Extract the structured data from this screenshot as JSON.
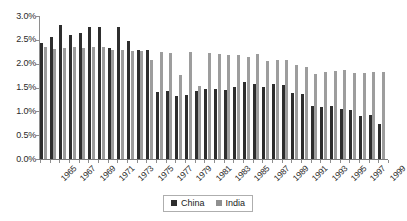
{
  "chart_data": {
    "type": "bar",
    "title": "",
    "subtitle": "",
    "xlabel": "",
    "ylabel": "",
    "ylim": [
      0,
      3.0
    ],
    "ytick_labels": [
      "3.0%",
      "2.5%",
      "2.0%",
      "1.5%",
      "1.0%",
      "0.5%",
      "0.0%"
    ],
    "ytick_values": [
      3.0,
      2.5,
      2.0,
      1.5,
      1.0,
      0.5,
      0.0
    ],
    "grid": false,
    "legend_position": "bottom-center",
    "x": [
      1965,
      1966,
      1967,
      1968,
      1969,
      1970,
      1971,
      1972,
      1973,
      1974,
      1975,
      1976,
      1977,
      1978,
      1979,
      1980,
      1981,
      1982,
      1983,
      1984,
      1985,
      1986,
      1987,
      1988,
      1989,
      1990,
      1991,
      1992,
      1993,
      1994,
      1995,
      1996,
      1997,
      1998,
      1999,
      2000
    ],
    "categories": [
      "1965",
      "1966",
      "1967",
      "1968",
      "1969",
      "1970",
      "1971",
      "1972",
      "1973",
      "1974",
      "1975",
      "1976",
      "1977",
      "1978",
      "1979",
      "1980",
      "1981",
      "1982",
      "1983",
      "1984",
      "1985",
      "1986",
      "1987",
      "1988",
      "1989",
      "1990",
      "1991",
      "1992",
      "1993",
      "1994",
      "1995",
      "1996",
      "1997",
      "1998",
      "1999",
      "2000"
    ],
    "xtick_labels_shown": [
      "1965",
      "1967",
      "1969",
      "1971",
      "1973",
      "1975",
      "1977",
      "1979",
      "1981",
      "1983",
      "1985",
      "1987",
      "1989",
      "1991",
      "1993",
      "1995",
      "1997",
      "1999"
    ],
    "series": [
      {
        "name": "China",
        "color": "#2e2e2e",
        "values": [
          2.44,
          2.55,
          2.82,
          2.6,
          2.65,
          2.78,
          2.77,
          2.32,
          2.77,
          2.48,
          2.28,
          2.28,
          1.4,
          1.42,
          1.32,
          1.35,
          1.43,
          1.46,
          1.46,
          1.44,
          1.52,
          1.61,
          1.58,
          1.52,
          1.58,
          1.55,
          1.38,
          1.36,
          1.12,
          1.1,
          1.12,
          1.04,
          1.02,
          0.91,
          0.92,
          0.74
        ]
      },
      {
        "name": "India",
        "color": "#9d9d9d",
        "values": [
          2.35,
          2.31,
          2.33,
          2.35,
          2.33,
          2.35,
          2.35,
          2.29,
          2.29,
          2.26,
          2.26,
          2.07,
          2.25,
          2.22,
          1.76,
          2.24,
          1.54,
          2.22,
          2.21,
          2.18,
          2.19,
          2.13,
          2.2,
          2.06,
          2.08,
          2.07,
          1.98,
          1.92,
          1.79,
          1.82,
          1.84,
          1.86,
          1.8,
          1.81,
          1.82,
          1.82
        ]
      }
    ]
  },
  "legend": {
    "items": [
      {
        "label": "China",
        "color": "#2e2e2e"
      },
      {
        "label": "India",
        "color": "#8f8f8f"
      }
    ]
  }
}
